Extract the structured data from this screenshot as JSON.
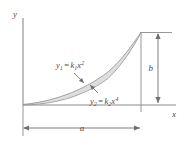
{
  "figure": {
    "axes": {
      "y_label": "y",
      "x_label": "x"
    },
    "dimensions": {
      "width_label": "a",
      "height_label": "b"
    },
    "curves": [
      {
        "id": "upper-curve",
        "name": "y1",
        "var": "y",
        "var_sub": "1",
        "equals": "=",
        "coef": "k",
        "coef_sub": "1",
        "x": "x",
        "exponent": "2",
        "full_label": "y1 = k1x2"
      },
      {
        "id": "lower-curve",
        "name": "y2",
        "var": "y",
        "var_sub": "2",
        "equals": "=",
        "coef": "k",
        "coef_sub": "2",
        "x": "x",
        "exponent": "4",
        "full_label": "y2 = k2x4"
      }
    ],
    "colors": {
      "shade_fill": "#dededd",
      "curve_stroke": "#9a9a9a",
      "axis_stroke": "#8b8b8b",
      "text": "#4a4a4a",
      "dim_stroke": "#6f6f6f"
    }
  }
}
